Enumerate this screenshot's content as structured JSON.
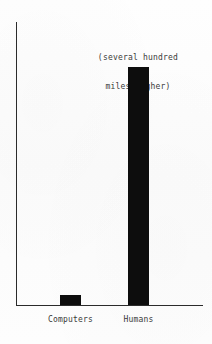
{
  "chart_data": {
    "type": "bar",
    "title": "",
    "xlabel": "",
    "ylabel": "",
    "categories": [
      "Computers",
      "Humans"
    ],
    "values": [
      10,
      238
    ],
    "value_unit": "arbitrary (pixel height, unlabeled axis)",
    "ylim": [
      0,
      283
    ],
    "grid": false,
    "legend": false,
    "axis_ticks": [],
    "annotations": [
      {
        "target_category": "Humans",
        "position": "above-bar",
        "lines": [
          "(several hundred",
          "miles higher)"
        ],
        "text": "(several hundred miles higher)"
      }
    ],
    "colors": {
      "bar": "#0d0d0d",
      "axis": "#2b2b2b",
      "text": "#3a3a3a",
      "background": "#fdfdfd"
    }
  },
  "labels": {
    "computers": "Computers",
    "humans": "Humans"
  },
  "annotation": {
    "line1": "(several hundred",
    "line2": "miles higher)"
  }
}
